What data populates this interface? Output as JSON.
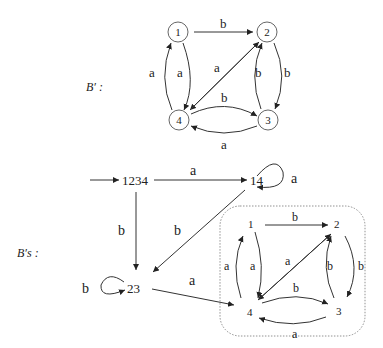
{
  "top_graph": {
    "name": "B′ :",
    "nodes": [
      {
        "id": "1",
        "label": "1"
      },
      {
        "id": "2",
        "label": "2"
      },
      {
        "id": "3",
        "label": "3"
      },
      {
        "id": "4",
        "label": "4"
      }
    ],
    "edges": [
      {
        "from": "1",
        "to": "2",
        "label": "b"
      },
      {
        "from": "1",
        "to": "4",
        "label": "a"
      },
      {
        "from": "4",
        "to": "1",
        "label": "a"
      },
      {
        "from": "2",
        "to": "4",
        "label": "a"
      },
      {
        "from": "2",
        "to": "3",
        "label": "b"
      },
      {
        "from": "3",
        "to": "2",
        "label": "b"
      },
      {
        "from": "4",
        "to": "3",
        "label": "b"
      },
      {
        "from": "3",
        "to": "4",
        "label": "a"
      }
    ]
  },
  "bottom_graph": {
    "name": "B′s :",
    "nodes": [
      {
        "id": "1234",
        "label": "1234",
        "initial": true
      },
      {
        "id": "14",
        "label": "14"
      },
      {
        "id": "23",
        "label": "23"
      },
      {
        "id": "inner",
        "label": "1,2,3,4 (boxed)"
      }
    ],
    "edges": [
      {
        "from": "1234",
        "to": "14",
        "label": "a"
      },
      {
        "from": "1234",
        "to": "23",
        "label": "b"
      },
      {
        "from": "14",
        "to": "14",
        "label": "a"
      },
      {
        "from": "14",
        "to": "23",
        "label": "b"
      },
      {
        "from": "23",
        "to": "23",
        "label": "b"
      },
      {
        "from": "23",
        "to": "4",
        "label": "a"
      }
    ],
    "inner": {
      "nodes": [
        "1",
        "2",
        "3",
        "4"
      ],
      "labels": {
        "e12": "b",
        "e14": "a",
        "e41": "a",
        "e24": "a",
        "e23": "b",
        "e32": "b",
        "e43": "b",
        "e34": "a"
      }
    }
  },
  "labels": {
    "B_prime": "B′ :",
    "B_s_prime": "B′s :",
    "n1": "1",
    "n2": "2",
    "n3": "3",
    "n4": "4",
    "n1234": "1234",
    "n14": "14",
    "n23": "23",
    "a": "a",
    "b": "b"
  }
}
